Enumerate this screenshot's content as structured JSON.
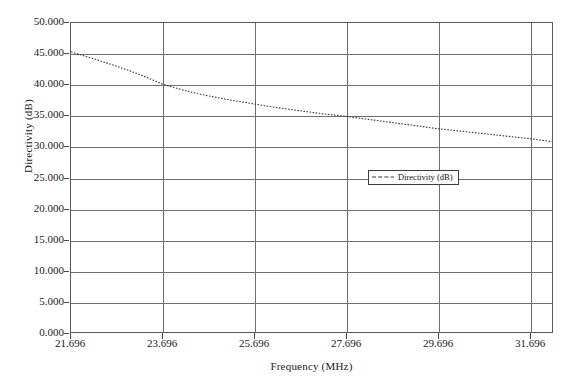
{
  "chart_data": {
    "type": "line",
    "title": "",
    "xlabel": "Frequency (MHz)",
    "ylabel": "Directivity (dB)",
    "xlim": [
      21.696,
      32.196
    ],
    "ylim": [
      0.0,
      50.0
    ],
    "grid": true,
    "legend_position": "center-right",
    "xticks": [
      "21.696",
      "23.696",
      "25.696",
      "27.696",
      "29.696",
      "31.696"
    ],
    "xtick_values": [
      21.696,
      23.696,
      25.696,
      27.696,
      29.696,
      31.696
    ],
    "yticks": [
      "0.000",
      "5.000",
      "10.000",
      "15.000",
      "20.000",
      "25.000",
      "30.000",
      "35.000",
      "40.000",
      "45.000",
      "50.000"
    ],
    "ytick_values": [
      0.0,
      5.0,
      10.0,
      15.0,
      20.0,
      25.0,
      30.0,
      35.0,
      40.0,
      45.0,
      50.0
    ],
    "series": [
      {
        "name": "Directivity (dB)",
        "style": "dotted",
        "color": "#3a3a3a",
        "x": [
          21.696,
          21.946,
          22.196,
          22.446,
          22.696,
          22.946,
          23.196,
          23.446,
          23.696,
          23.946,
          24.196,
          24.446,
          24.696,
          24.946,
          25.196,
          25.446,
          25.696,
          25.946,
          26.196,
          26.446,
          26.696,
          26.946,
          27.196,
          27.446,
          27.696,
          27.946,
          28.196,
          28.446,
          28.696,
          28.946,
          29.196,
          29.446,
          29.696,
          29.946,
          30.196,
          30.446,
          30.696,
          30.946,
          31.196,
          31.446,
          31.696,
          31.946,
          32.196
        ],
        "y": [
          45.35,
          44.75,
          44.2,
          43.6,
          43.0,
          42.35,
          41.65,
          40.9,
          40.1,
          39.55,
          39.05,
          38.6,
          38.2,
          37.85,
          37.5,
          37.2,
          36.9,
          36.6,
          36.3,
          36.05,
          35.8,
          35.55,
          35.3,
          35.1,
          34.9,
          34.65,
          34.4,
          34.15,
          33.9,
          33.65,
          33.4,
          33.15,
          32.9,
          32.7,
          32.5,
          32.3,
          32.1,
          31.9,
          31.7,
          31.5,
          31.3,
          31.05,
          30.8
        ]
      }
    ]
  },
  "legend": {
    "label": "Directivity (dB)"
  },
  "axes": {
    "x_title": "Frequency (MHz)",
    "y_title": "Directivity (dB)"
  },
  "artifact": {
    "bottom_text": ""
  }
}
